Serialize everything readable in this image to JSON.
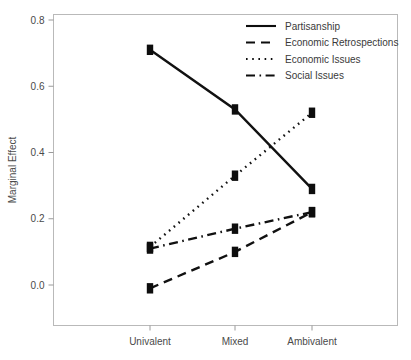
{
  "chart_data": {
    "type": "line",
    "title": "",
    "xlabel": "",
    "ylabel": "Marginal Effect",
    "categories": [
      "Univalent",
      "Mixed",
      "Ambivalent"
    ],
    "ylim": [
      -0.08,
      0.85
    ],
    "yticks": [
      0.0,
      0.2,
      0.4,
      0.6,
      0.8
    ],
    "ytick_labels": [
      "0.0",
      "0.2",
      "0.4",
      "0.6",
      "0.8"
    ],
    "grid": false,
    "legend_position": "top-right",
    "series": [
      {
        "name": "Partisanship",
        "style": "solid",
        "values": [
          0.71,
          0.53,
          0.29
        ]
      },
      {
        "name": "Economic Retrospections",
        "style": "dashed",
        "values": [
          -0.01,
          0.1,
          0.22
        ]
      },
      {
        "name": "Economic Issues",
        "style": "dotted",
        "values": [
          0.115,
          0.33,
          0.52
        ]
      },
      {
        "name": "Social Issues",
        "style": "dashdot",
        "values": [
          0.11,
          0.17,
          0.22
        ]
      }
    ],
    "colors": {
      "series": "#0d0d0d",
      "frame": "#b9b9b9",
      "text": "#4a4a4a",
      "background": "#ffffff"
    }
  }
}
